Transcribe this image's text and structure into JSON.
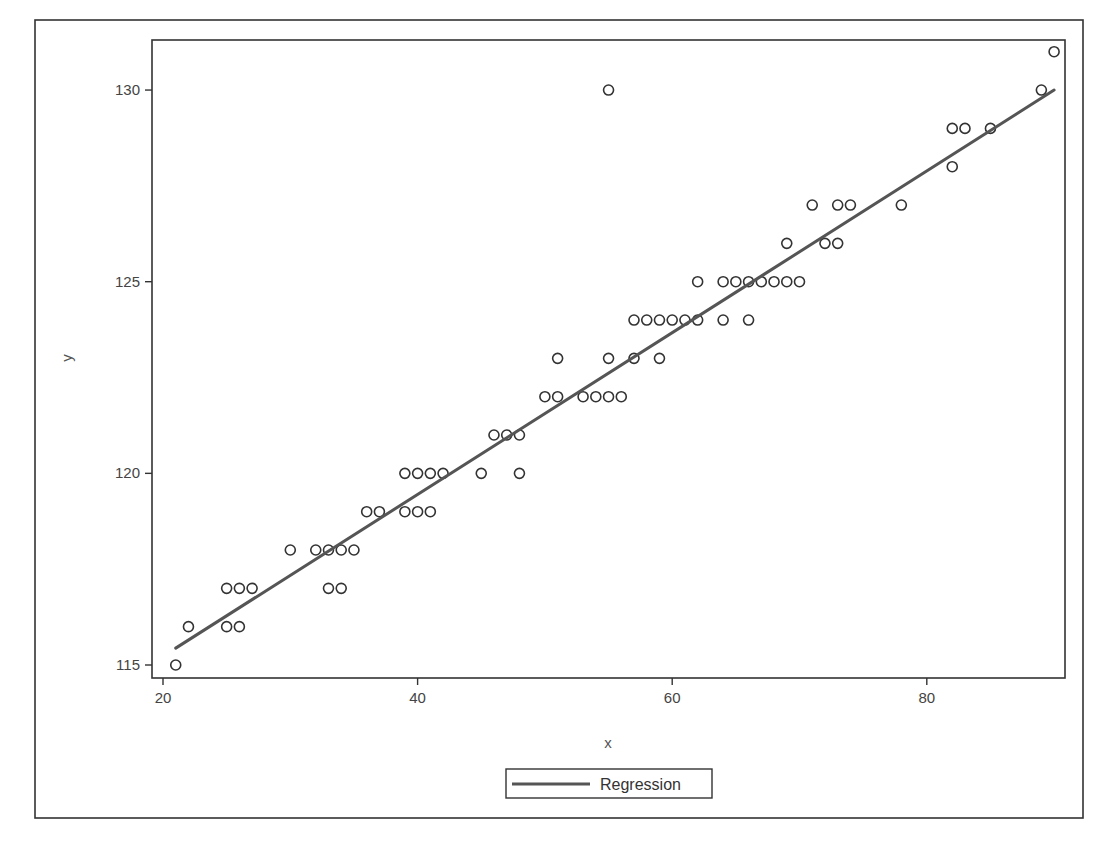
{
  "chart_data": {
    "type": "scatter",
    "title": "",
    "xlabel": "x",
    "ylabel": "y",
    "xlim": [
      19,
      91
    ],
    "ylim": [
      114.7,
      131.3
    ],
    "x_ticks": [
      20,
      40,
      60,
      80
    ],
    "y_ticks": [
      115,
      120,
      125,
      130
    ],
    "x_tick_labels": [
      "20",
      "40",
      "60",
      "80"
    ],
    "y_tick_labels": [
      "115",
      "120",
      "125",
      "130"
    ],
    "grid": false,
    "legend": {
      "position": "bottom-center",
      "entries": [
        "Regression"
      ]
    },
    "series": [
      {
        "name": "Observations",
        "type": "scatter",
        "marker": "open-circle",
        "points": [
          [
            21,
            115
          ],
          [
            22,
            116
          ],
          [
            25,
            116
          ],
          [
            26,
            116
          ],
          [
            25,
            117
          ],
          [
            26,
            117
          ],
          [
            27,
            117
          ],
          [
            30,
            118
          ],
          [
            32,
            118
          ],
          [
            33,
            118
          ],
          [
            34,
            118
          ],
          [
            35,
            118
          ],
          [
            33,
            117
          ],
          [
            34,
            117
          ],
          [
            36,
            119
          ],
          [
            37,
            119
          ],
          [
            39,
            119
          ],
          [
            40,
            119
          ],
          [
            41,
            119
          ],
          [
            39,
            120
          ],
          [
            40,
            120
          ],
          [
            41,
            120
          ],
          [
            42,
            120
          ],
          [
            45,
            120
          ],
          [
            48,
            120
          ],
          [
            46,
            121
          ],
          [
            47,
            121
          ],
          [
            48,
            121
          ],
          [
            50,
            122
          ],
          [
            51,
            122
          ],
          [
            53,
            122
          ],
          [
            54,
            122
          ],
          [
            55,
            122
          ],
          [
            56,
            122
          ],
          [
            51,
            123
          ],
          [
            55,
            123
          ],
          [
            57,
            123
          ],
          [
            59,
            123
          ],
          [
            57,
            124
          ],
          [
            58,
            124
          ],
          [
            59,
            124
          ],
          [
            60,
            124
          ],
          [
            61,
            124
          ],
          [
            62,
            124
          ],
          [
            64,
            124
          ],
          [
            66,
            124
          ],
          [
            62,
            125
          ],
          [
            64,
            125
          ],
          [
            65,
            125
          ],
          [
            66,
            125
          ],
          [
            67,
            125
          ],
          [
            68,
            125
          ],
          [
            69,
            125
          ],
          [
            70,
            125
          ],
          [
            69,
            126
          ],
          [
            72,
            126
          ],
          [
            73,
            126
          ],
          [
            71,
            127
          ],
          [
            73,
            127
          ],
          [
            74,
            127
          ],
          [
            78,
            127
          ],
          [
            82,
            128
          ],
          [
            82,
            129
          ],
          [
            83,
            129
          ],
          [
            85,
            129
          ],
          [
            55,
            130
          ],
          [
            89,
            130
          ],
          [
            90,
            131
          ]
        ]
      },
      {
        "name": "Regression",
        "type": "line",
        "x": [
          21,
          90
        ],
        "y": [
          115.44,
          130.0
        ],
        "slope": 0.211,
        "intercept": 111.01
      }
    ]
  },
  "labels": {
    "x_axis": "x",
    "y_axis": "y",
    "legend_regression": "Regression"
  },
  "colors": {
    "frame": "#333333",
    "points": "#333333",
    "regression": "#555555",
    "text": "#444444"
  }
}
